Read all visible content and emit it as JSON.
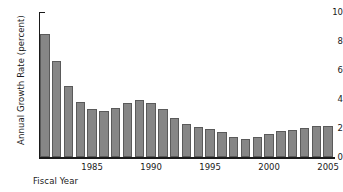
{
  "chart_data": {
    "type": "bar",
    "title": "",
    "xlabel": "Fiscal Year",
    "ylabel": "Annual Growth Rate (percent)",
    "categories": [
      1981,
      1982,
      1983,
      1984,
      1985,
      1986,
      1987,
      1988,
      1989,
      1990,
      1991,
      1992,
      1993,
      1994,
      1995,
      1996,
      1997,
      1998,
      1999,
      2000,
      2001,
      2002,
      2003,
      2004,
      2005
    ],
    "values": [
      8.5,
      6.6,
      4.9,
      3.8,
      3.3,
      3.2,
      3.4,
      3.75,
      3.95,
      3.75,
      3.3,
      2.7,
      2.25,
      2.05,
      1.95,
      1.7,
      1.4,
      1.25,
      1.35,
      1.6,
      1.8,
      1.85,
      2.0,
      2.15,
      2.15
    ],
    "xlim": [
      1980.5,
      2005.5
    ],
    "ylim": [
      0,
      10
    ],
    "ytick_values": [
      0,
      2,
      4,
      6,
      8,
      10
    ],
    "ytick_labels": [
      "0",
      "2",
      "4",
      "6",
      "8",
      "10"
    ],
    "xtick_values": [
      1985,
      1990,
      1995,
      2000,
      2005
    ],
    "xtick_labels": [
      "1985",
      "1990",
      "1995",
      "2000",
      "2005"
    ],
    "grid": false,
    "legend": null,
    "bar_color": "#868686",
    "bar_edge_color": "#5a5a5a",
    "axis_color": "#1a1a1a",
    "background_color": "#ffffff"
  }
}
